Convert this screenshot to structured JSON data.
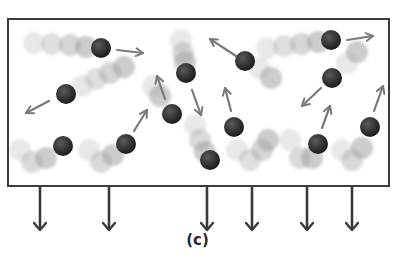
{
  "figure": {
    "caption": "(c)"
  },
  "colors": {
    "box_border": "#3c3c3c",
    "particle": "#2b2b2b",
    "trail": "#9a9a9a",
    "motion_arrow": "#7a7a7a",
    "down_arrow": "#3a3a3a",
    "background": "#ffffff"
  },
  "container": {
    "x": 8,
    "y": 19,
    "width": 381,
    "height": 167
  },
  "particles": [
    {
      "x": 101,
      "y": 48,
      "trail": [
        [
          34,
          43
        ],
        [
          52,
          44
        ],
        [
          70,
          45
        ],
        [
          86,
          47
        ]
      ],
      "arrow": [
        [
          117,
          50
        ],
        [
          143,
          53
        ]
      ]
    },
    {
      "x": 66,
      "y": 94,
      "trail": [
        [
          82,
          86
        ],
        [
          96,
          79
        ],
        [
          110,
          73
        ],
        [
          124,
          67
        ]
      ],
      "arrow": [
        [
          49,
          101
        ],
        [
          26,
          113
        ]
      ]
    },
    {
      "x": 186,
      "y": 73,
      "trail": [
        [
          181,
          40
        ],
        [
          183,
          53
        ],
        [
          185,
          62
        ]
      ],
      "arrow": [
        [
          192,
          90
        ],
        [
          201,
          115
        ]
      ]
    },
    {
      "x": 245,
      "y": 61,
      "trail": [
        [
          259,
          68
        ],
        [
          271,
          78
        ]
      ],
      "arrow": [
        [
          236,
          56
        ],
        [
          210,
          39
        ]
      ]
    },
    {
      "x": 331,
      "y": 40,
      "trail": [
        [
          267,
          48
        ],
        [
          284,
          46
        ],
        [
          301,
          44
        ],
        [
          318,
          42
        ]
      ],
      "arrow": [
        [
          347,
          40
        ],
        [
          373,
          36
        ]
      ]
    },
    {
      "x": 332,
      "y": 78,
      "trail": [
        [
          347,
          63
        ],
        [
          357,
          52
        ]
      ],
      "arrow": [
        [
          321,
          88
        ],
        [
          302,
          106
        ]
      ]
    },
    {
      "x": 172,
      "y": 114,
      "trail": [
        [
          153,
          86
        ],
        [
          160,
          96
        ]
      ],
      "arrow": [
        [
          165,
          99
        ],
        [
          157,
          76
        ]
      ]
    },
    {
      "x": 126,
      "y": 144,
      "trail": [
        [
          89,
          150
        ],
        [
          101,
          162
        ],
        [
          113,
          155
        ]
      ],
      "arrow": [
        [
          134,
          131
        ],
        [
          147,
          110
        ]
      ]
    },
    {
      "x": 63,
      "y": 146,
      "trail": [
        [
          20,
          150
        ],
        [
          32,
          162
        ],
        [
          46,
          158
        ]
      ],
      "arrow": null
    },
    {
      "x": 234,
      "y": 127,
      "trail": [
        [
          237,
          150
        ],
        [
          250,
          160
        ],
        [
          262,
          150
        ],
        [
          268,
          140
        ]
      ],
      "arrow": [
        [
          231,
          111
        ],
        [
          225,
          88
        ]
      ]
    },
    {
      "x": 318,
      "y": 144,
      "trail": [
        [
          290,
          140
        ],
        [
          300,
          158
        ],
        [
          312,
          158
        ]
      ],
      "arrow": [
        [
          322,
          128
        ],
        [
          330,
          106
        ]
      ]
    },
    {
      "x": 370,
      "y": 127,
      "trail": [
        [
          342,
          150
        ],
        [
          352,
          160
        ],
        [
          362,
          148
        ]
      ],
      "arrow": [
        [
          374,
          111
        ],
        [
          383,
          86
        ]
      ]
    },
    {
      "x": 210,
      "y": 160,
      "trail": [
        [
          195,
          125
        ],
        [
          200,
          140
        ],
        [
          205,
          152
        ]
      ],
      "arrow": null
    }
  ],
  "exit_arrows": [
    {
      "x": 40
    },
    {
      "x": 109
    },
    {
      "x": 207
    },
    {
      "x": 252
    },
    {
      "x": 307
    },
    {
      "x": 352
    }
  ],
  "exit_arrow_geometry": {
    "y1": 187,
    "y2": 230
  }
}
